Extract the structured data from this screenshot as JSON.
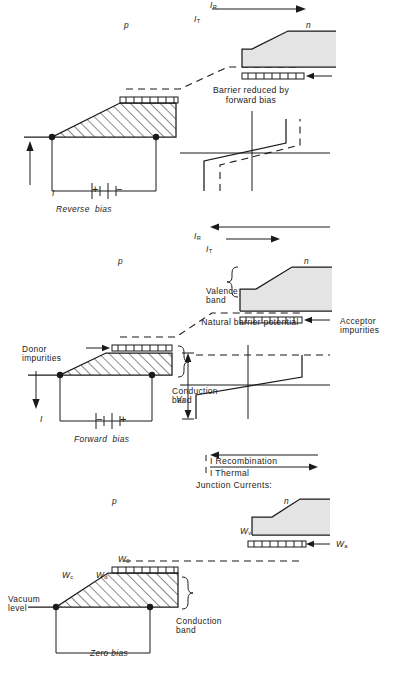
{
  "figure": {
    "type": "diagram",
    "rotation_deg": -90,
    "colors": {
      "line": "#1a1a1a",
      "shade_valence": "#e4e4e4",
      "background": "#ffffff"
    }
  },
  "panels": [
    {
      "id": "zero-bias",
      "bias_label": "Zero bias",
      "caption": "Natural barrier potential",
      "band_labels": {
        "vacuum_level": "Vacuum level",
        "conduction_band": "Conduction\nband",
        "valence_band": "",
        "wc": "W",
        "wc_sub": "c",
        "wd": "W",
        "wd_sub": "d",
        "w0": "W",
        "w0_sub": "0",
        "wa": "W",
        "wa_sub": "a",
        "wv": "W",
        "wv_sub": "v",
        "n_region": "n",
        "p_region": "p"
      },
      "currents": {
        "heading": "Junction Currents:",
        "thermal": "I Thermal",
        "recombination": "I Recombination",
        "thermal_arrow": "left",
        "recombination_arrow": "right",
        "thermal_length": "long",
        "recombination_length": "long"
      },
      "potential_plot": {
        "barrier_label": "V",
        "barrier_label_sub": "d",
        "has_dashed_shifted_curve": false
      },
      "source": null
    },
    {
      "id": "forward-bias",
      "bias_label": "Forward  bias",
      "caption": "Barrier reduced by\nforward bias",
      "band_labels": {
        "conduction_band": "Conduction\nband",
        "valence_band": "Valence\nband",
        "donor_impurities": "Donor\nimpurities",
        "acceptor_impurities": "Acceptor\nimpurities",
        "n_region": "n",
        "p_region": "p"
      },
      "currents": {
        "thermal": "I",
        "thermal_sub": "T",
        "recombination": "I",
        "recombination_sub": "R",
        "thermal_length": "short",
        "recombination_length": "long"
      },
      "source": {
        "current_label": "I",
        "current_direction": "left",
        "terminal_top": "−",
        "terminal_bottom": "+"
      }
    },
    {
      "id": "reverse-bias",
      "bias_label": "Reverse  bias",
      "caption": "Barrier increased by\nreverse bias",
      "band_labels": {
        "n_region": "n",
        "p_region": "p"
      },
      "currents": {
        "thermal": "I",
        "thermal_sub": "T",
        "recombination": "I",
        "recombination_sub": "R",
        "thermal_length": "long",
        "recombination_length": "short"
      },
      "source": {
        "current_label": "I",
        "current_direction": "right",
        "terminal_top": "+",
        "terminal_bottom": "−"
      }
    }
  ],
  "shared_labels": {
    "donor_impurities": "Donor\nimpurities",
    "acceptor_impurities": "Acceptor\nimpurities",
    "valence_band": "Valence\nband",
    "conduction_band": "Conduction\nband",
    "vacuum_level": "Vacuum\nlevel",
    "junction_currents_heading": "Junction Currents:",
    "i_thermal": "I Thermal",
    "i_recombination": "I Recombination"
  }
}
